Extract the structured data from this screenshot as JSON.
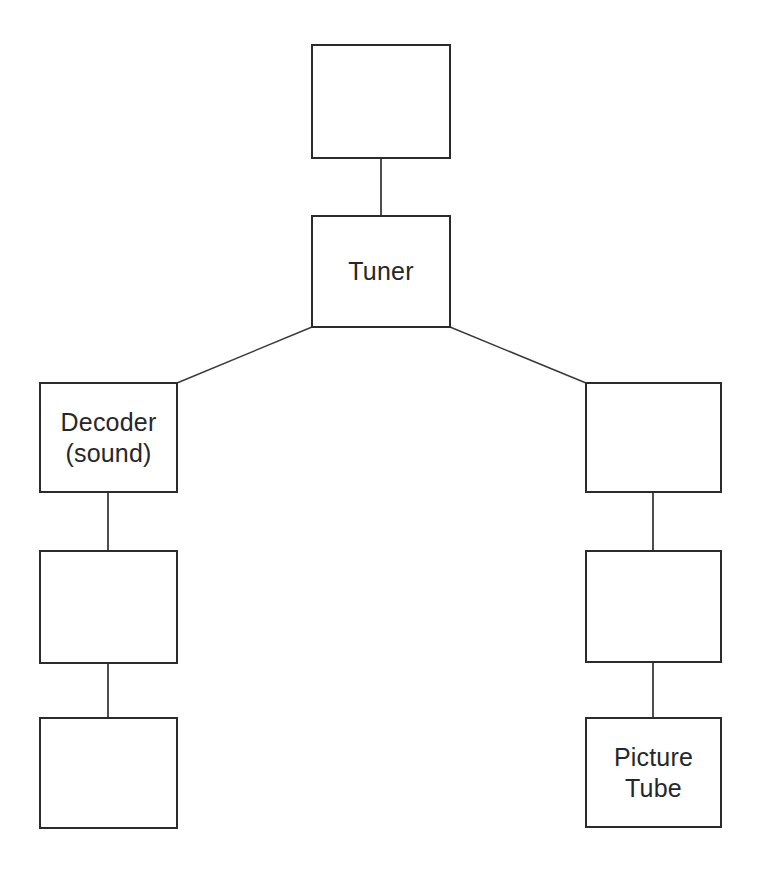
{
  "diagram": {
    "type": "block-diagram",
    "title": "",
    "clipped_top_caption": "p                         g                    p",
    "canvas": {
      "width": 757,
      "height": 870
    },
    "style": {
      "background_color": "#ffffff",
      "box_fill": "#ffffff",
      "box_stroke_color": "#2b2b2b",
      "box_stroke_width": 2,
      "connector_color": "#3a3a3a",
      "connector_width": 1.6,
      "text_color": "#272727",
      "font_size_px": 25
    },
    "nodes": [
      {
        "id": "antenna",
        "label": "",
        "x": 312,
        "y": 45,
        "w": 138,
        "h": 113,
        "column": "center",
        "row": 0
      },
      {
        "id": "tuner",
        "label": "Tuner",
        "x": 312,
        "y": 216,
        "w": 138,
        "h": 111,
        "column": "center",
        "row": 1
      },
      {
        "id": "decoder-sound",
        "label": "Decoder\n(sound)",
        "x": 40,
        "y": 383,
        "w": 137,
        "h": 109,
        "column": "left",
        "row": 2
      },
      {
        "id": "left-middle",
        "label": "",
        "x": 40,
        "y": 551,
        "w": 137,
        "h": 112,
        "column": "left",
        "row": 3
      },
      {
        "id": "left-bottom",
        "label": "",
        "x": 40,
        "y": 718,
        "w": 137,
        "h": 110,
        "column": "left",
        "row": 4
      },
      {
        "id": "right-top",
        "label": "",
        "x": 586,
        "y": 383,
        "w": 135,
        "h": 109,
        "column": "right",
        "row": 2
      },
      {
        "id": "right-middle",
        "label": "",
        "x": 586,
        "y": 551,
        "w": 135,
        "h": 111,
        "column": "right",
        "row": 3
      },
      {
        "id": "picture-tube",
        "label": "Picture\nTube",
        "x": 586,
        "y": 718,
        "w": 135,
        "h": 109,
        "column": "right",
        "row": 4
      }
    ],
    "edges": [
      {
        "id": "antenna-to-tuner",
        "from": "antenna",
        "to": "tuner",
        "kind": "vertical",
        "x1": 381,
        "y1": 158,
        "x2": 381,
        "y2": 216
      },
      {
        "id": "tuner-to-decoder",
        "from": "tuner",
        "to": "decoder-sound",
        "kind": "diagonal",
        "x1": 312,
        "y1": 327,
        "x2": 177,
        "y2": 383
      },
      {
        "id": "tuner-to-right-top",
        "from": "tuner",
        "to": "right-top",
        "kind": "diagonal",
        "x1": 450,
        "y1": 327,
        "x2": 586,
        "y2": 383
      },
      {
        "id": "decoder-to-left-middle",
        "from": "decoder-sound",
        "to": "left-middle",
        "kind": "vertical",
        "x1": 108,
        "y1": 492,
        "x2": 108,
        "y2": 551
      },
      {
        "id": "left-middle-to-left-bottom",
        "from": "left-middle",
        "to": "left-bottom",
        "kind": "vertical",
        "x1": 108,
        "y1": 663,
        "x2": 108,
        "y2": 718
      },
      {
        "id": "right-top-to-right-middle",
        "from": "right-top",
        "to": "right-middle",
        "kind": "vertical",
        "x1": 653,
        "y1": 492,
        "x2": 653,
        "y2": 551
      },
      {
        "id": "right-middle-to-picture-tube",
        "from": "right-middle",
        "to": "picture-tube",
        "kind": "vertical",
        "x1": 653,
        "y1": 662,
        "x2": 653,
        "y2": 718
      }
    ]
  }
}
